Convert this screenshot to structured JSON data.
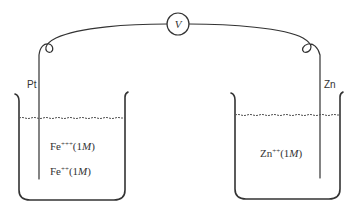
{
  "diagram": {
    "type": "electrochemical-cell",
    "meter": {
      "symbol": "V",
      "name": "voltmeter"
    },
    "electrodes": [
      {
        "label": "Pt",
        "side": "left"
      },
      {
        "label": "Zn",
        "side": "right"
      }
    ],
    "beakers": [
      {
        "side": "left",
        "solutions": [
          {
            "ion": "Fe",
            "charge": "+++",
            "concentration": "(1",
            "unit": "M",
            "close": ")"
          },
          {
            "ion": "Fe",
            "charge": "++",
            "concentration": "(1",
            "unit": "M",
            "close": ")"
          }
        ]
      },
      {
        "side": "right",
        "solutions": [
          {
            "ion": "Zn",
            "charge": "++",
            "concentration": "(1",
            "unit": "M",
            "close": ")"
          }
        ]
      }
    ],
    "colors": {
      "line": "#333333",
      "background": "#ffffff"
    }
  }
}
